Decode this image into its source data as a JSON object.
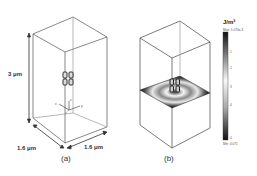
{
  "panel_a": {
    "caption": "(a)",
    "height_label": "3 μm",
    "depth_label": "1.6 μm",
    "width_label": "1.6 μm",
    "axis_labels": {
      "z": "z",
      "x": "x",
      "y": "y"
    }
  },
  "panel_b": {
    "caption": "(b)",
    "colorbar": {
      "unit": "J/m³",
      "max_label": "Max: 5.074e-3",
      "min_label": "Min: 0.071",
      "ticks": [
        "5",
        "4",
        "3",
        "2",
        "1",
        "0"
      ]
    },
    "colors": {
      "high": "#111111",
      "mid": "#f2f2f2",
      "low": "#222222"
    }
  }
}
